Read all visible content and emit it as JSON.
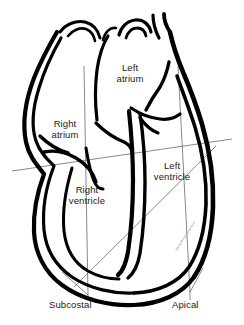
{
  "figure": {
    "type": "anatomical-line-drawing",
    "background_color": "#ffffff",
    "outline_color": "#000000",
    "guide_line_color": "#5a5a5a",
    "text_color": "#1a1a1a"
  },
  "chambers": [
    {
      "id": "left-atrium",
      "label": "Left\natrium"
    },
    {
      "id": "right-atrium",
      "label": "Right\natrium"
    },
    {
      "id": "left-ventricle",
      "label": "Left\nventricle"
    },
    {
      "id": "right-ventricle",
      "label": "Right\nventricle"
    }
  ],
  "imaging_planes": [
    {
      "id": "subcostal",
      "label": "Subcostal"
    },
    {
      "id": "apical",
      "label": "Apical"
    }
  ],
  "annotations": {
    "diagonal_micro_text": "parasternal long axis"
  }
}
